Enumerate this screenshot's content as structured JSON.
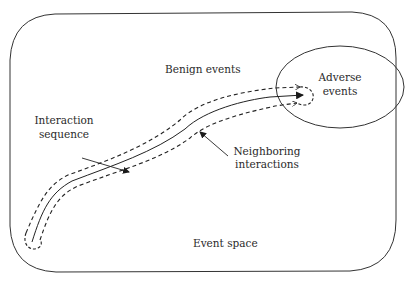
{
  "diagram": {
    "container": {
      "label": "Event space"
    },
    "regions": [
      {
        "id": "benign",
        "label": "Benign events"
      },
      {
        "id": "adverse",
        "label_lines": [
          "Adverse",
          "events"
        ]
      }
    ],
    "paths": [
      {
        "id": "interaction-sequence",
        "style": "solid",
        "label_lines": [
          "Interaction",
          "sequence"
        ]
      },
      {
        "id": "neighboring-interactions",
        "style": "dashed",
        "label_lines": [
          "Neighboring",
          "interactions"
        ]
      }
    ],
    "colors": {
      "stroke": "#2a2a2a",
      "background": "#ffffff"
    }
  }
}
